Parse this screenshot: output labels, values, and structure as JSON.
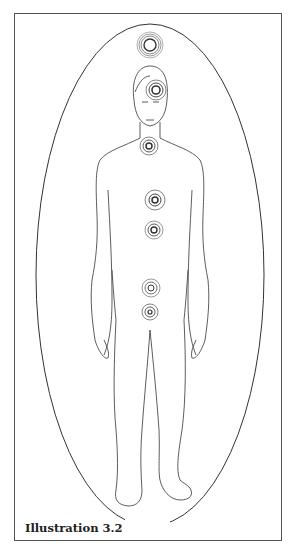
{
  "figure": {
    "caption": "Illustration 3.2",
    "colors": {
      "line": "#333333",
      "background": "#ffffff"
    },
    "energy_centers": [
      {
        "name": "crown-above-head",
        "cx": 150,
        "cy": 45
      },
      {
        "name": "forehead",
        "cx": 150,
        "cy": 88
      },
      {
        "name": "throat",
        "cx": 149,
        "cy": 146
      },
      {
        "name": "chest",
        "cx": 155,
        "cy": 200
      },
      {
        "name": "solar-plexus",
        "cx": 154,
        "cy": 230
      },
      {
        "name": "lower-abdomen",
        "cx": 151,
        "cy": 288
      },
      {
        "name": "pelvis",
        "cx": 150,
        "cy": 312
      }
    ]
  }
}
